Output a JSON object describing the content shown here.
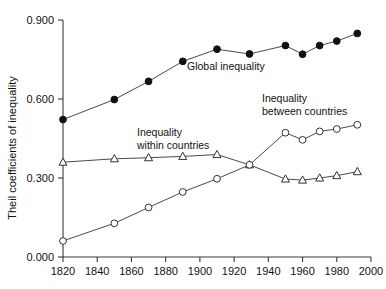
{
  "chart_data": {
    "type": "line",
    "title": "",
    "xlabel": "",
    "ylabel": "Theil coefficients of inequality",
    "xlim": [
      1820,
      2000
    ],
    "ylim": [
      0.0,
      0.9
    ],
    "grid": false,
    "legend_position": "inline-annotations",
    "x_ticks": [
      1820,
      1840,
      1860,
      1880,
      1900,
      1920,
      1940,
      1960,
      1980,
      2000
    ],
    "x_tick_labels": [
      "1820",
      "1840",
      "1860",
      "1880",
      "1900",
      "1920",
      "1940",
      "1960",
      "1980",
      "2000"
    ],
    "y_ticks": [
      0.0,
      0.3,
      0.6,
      0.9
    ],
    "y_tick_labels": [
      "0.000",
      "0.300",
      "0.600",
      "0.900"
    ],
    "series": [
      {
        "name": "Global inequality",
        "marker": "filled-circle",
        "annotation": "Global inequality",
        "x": [
          1820,
          1850,
          1870,
          1890,
          1910,
          1929,
          1950,
          1960,
          1970,
          1980,
          1992
        ],
        "values": [
          0.522,
          0.598,
          0.667,
          0.743,
          0.789,
          0.771,
          0.803,
          0.77,
          0.803,
          0.82,
          0.849
        ]
      },
      {
        "name": "Inequality within countries",
        "marker": "open-triangle",
        "annotation_line1": "Inequality",
        "annotation_line2": "within countries",
        "x": [
          1820,
          1850,
          1870,
          1890,
          1910,
          1929,
          1950,
          1960,
          1970,
          1980,
          1992
        ],
        "values": [
          0.36,
          0.373,
          0.377,
          0.382,
          0.389,
          0.35,
          0.296,
          0.292,
          0.3,
          0.309,
          0.324
        ]
      },
      {
        "name": "Inequality between countries",
        "marker": "open-circle",
        "annotation_line1": "Inequality",
        "annotation_line2": "between countries",
        "x": [
          1820,
          1850,
          1870,
          1890,
          1910,
          1929,
          1950,
          1960,
          1970,
          1980,
          1992
        ],
        "values": [
          0.061,
          0.128,
          0.188,
          0.247,
          0.297,
          0.35,
          0.472,
          0.445,
          0.477,
          0.486,
          0.502
        ]
      }
    ]
  }
}
